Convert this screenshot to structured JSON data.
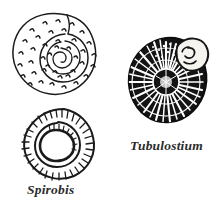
{
  "plate": {
    "title": "Fossil shell illustration plate",
    "background_color": "#ffffff",
    "ink_color": "#1a1a1a",
    "width": 213,
    "height": 210
  },
  "figures": [
    {
      "id": "stippled-spiral-shell",
      "name": "stippled-spiral-shell",
      "description": "Planispiral shell with stippled comma-shaped tubercles, outline drawing, top-left",
      "position": {
        "left": 10,
        "top": 10,
        "width": 86,
        "height": 88
      },
      "style": "outline-stippled",
      "fill_color": "#ffffff",
      "stroke_color": "#1a1a1a",
      "label": ""
    },
    {
      "id": "spirobis-shell",
      "name": "spirobis-shell",
      "description": "Planispiral coiled worm tube with radial comb hatching and large rounded aperture, lower-left",
      "position": {
        "left": 18,
        "top": 108,
        "width": 76,
        "height": 72
      },
      "style": "outline-radial-hatch",
      "fill_color": "#ffffff",
      "stroke_color": "#1a1a1a",
      "label": "Spirobis"
    },
    {
      "id": "tubulostium-shell",
      "name": "tubulostium-shell",
      "description": "Densely inked planispiral shell with radiating white streaks and pale aperture lobe at upper right",
      "position": {
        "left": 128,
        "top": 36,
        "width": 80,
        "height": 92
      },
      "style": "solid-inked-radial",
      "fill_color": "#141414",
      "stroke_color": "#0d0d0d",
      "label": "Tubulostium"
    }
  ],
  "labels": {
    "spirobis": "Spirobis",
    "tubulostium": "Tubulostium"
  }
}
